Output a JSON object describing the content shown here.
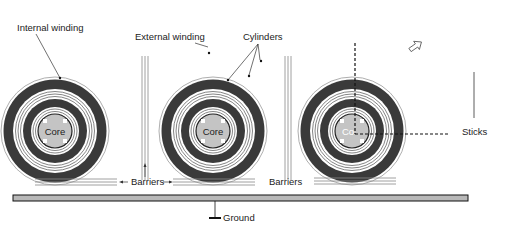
{
  "diagram": {
    "type": "transformer cross-section schematic",
    "labels": {
      "internal_winding": "Internal winding",
      "external_winding": "External winding",
      "cylinders": "Cylinders",
      "core": "Core",
      "core_partial": "Co",
      "barriers_left": "Barriers",
      "barriers_right": "Barriers",
      "sticks": "Sticks",
      "ground": "Ground"
    },
    "coils": [
      {
        "id": "coil-1",
        "cx": 55,
        "cy": 131
      },
      {
        "id": "coil-2",
        "cx": 213,
        "cy": 131
      },
      {
        "id": "coil-3",
        "cx": 352,
        "cy": 131
      }
    ],
    "colors": {
      "winding": "#3a3a3a",
      "core": "#c4c4c4",
      "ground_bar": "#b8b8b8",
      "line": "#222222",
      "barrier": "#888888"
    },
    "icons": {
      "zoom_arrow": "hollow-arrow-icon"
    }
  }
}
